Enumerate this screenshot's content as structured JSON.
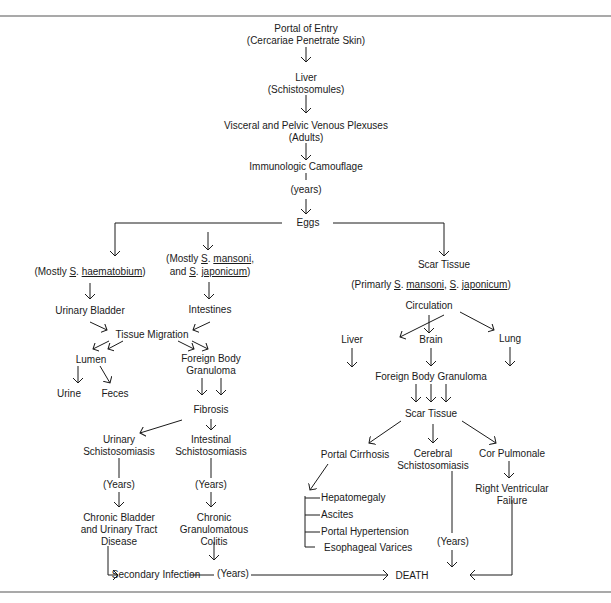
{
  "diagram": {
    "nodes": {
      "portal_of_entry": "Portal of Entry",
      "portal_of_entry_sub": "(Cercariae Penetrate Skin)",
      "liver_stage": "Liver",
      "liver_stage_sub": "(Schistosomules)",
      "plexuses": "Visceral and Pelvic Venous Plexuses",
      "plexuses_sub": "(Adults)",
      "camouflage": "Immunologic Camouflage",
      "camouflage_years": "(years)",
      "eggs": "Eggs",
      "haematobium": {
        "prefix": "(Mostly ",
        "genus": "S",
        "dot": ". ",
        "species": "haematobium",
        "suffix": ")"
      },
      "mansoni_line1": {
        "prefix": "(Mostly ",
        "genus": "S",
        "dot": ". ",
        "species": "mansoni",
        "suffix": ","
      },
      "mansoni_line2": {
        "prefix": "and ",
        "genus": "S",
        "dot": ". ",
        "species": "japonicum",
        "suffix": ")"
      },
      "urinary_bladder": "Urinary Bladder",
      "intestines": "Intestines",
      "tissue_migration": "Tissue Migration",
      "lumen": "Lumen",
      "urine": "Urine",
      "feces": "Feces",
      "fbg_left_1": "Foreign Body",
      "fbg_left_2": "Granuloma",
      "fibrosis": "Fibrosis",
      "urinary_schisto_1": "Urinary",
      "urinary_schisto_2": "Schistosomiasis",
      "intestinal_schisto_1": "Intestinal",
      "intestinal_schisto_2": "Schistosomiasis",
      "years_left": "(Years)",
      "years_mid": "(Years)",
      "chronic_bladder_1": "Chronic Bladder",
      "chronic_bladder_2": "and Urinary Tract",
      "chronic_bladder_3": "Disease",
      "chronic_colitis_1": "Chronic",
      "chronic_colitis_2": "Granulomatous",
      "chronic_colitis_3": "Colitis",
      "secondary_infection": "Secondary Infection",
      "years_bottom": "(Years)",
      "death": "DEATH",
      "scar_tissue_top": "Scar Tissue",
      "primarily": {
        "prefix": "(Primarly ",
        "genus1": "S",
        "dot1": ". ",
        "species1": "mansoni",
        "comma": ", ",
        "genus2": "S",
        "dot2": ". ",
        "species2": "japonicum",
        "suffix": ")"
      },
      "circulation": "Circulation",
      "liver_right": "Liver",
      "brain": "Brain",
      "lung": "Lung",
      "fbg_right": "Foreign Body Granuloma",
      "scar_tissue_mid": "Scar Tissue",
      "portal_cirrhosis": "Portal Cirrhosis",
      "cerebral_1": "Cerebral",
      "cerebral_2": "Schistosomiasis",
      "cor_pulmonale": "Cor Pulmonale",
      "rv_failure_1": "Right Ventricular",
      "rv_failure_2": "Failure",
      "cirrhosis_items": [
        "Hepatomegaly",
        "Ascites",
        "Portal Hypertension",
        "Esophageal Varices"
      ],
      "years_right": "(Years)"
    }
  }
}
